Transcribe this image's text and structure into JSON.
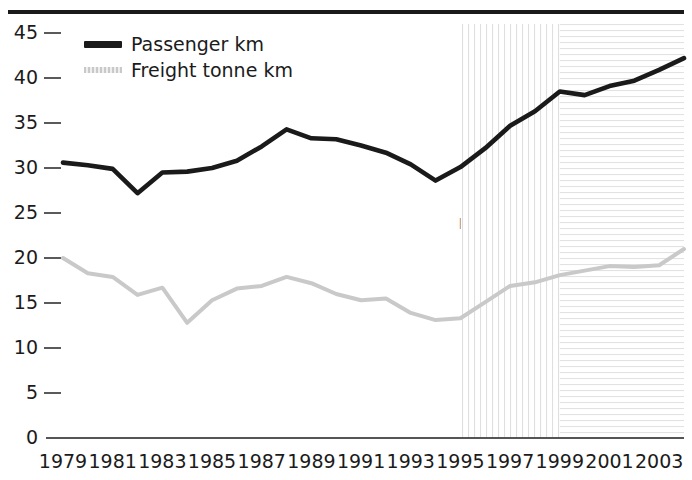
{
  "figure": {
    "background": "#ffffff",
    "top_rule_color": "#1a1a1a"
  },
  "legend": {
    "position": "top-left-inside",
    "items": [
      {
        "label": "Passenger km",
        "color": "#1a1a1a",
        "style": "solid-thick",
        "swatch_name": "passenger-swatch"
      },
      {
        "label": "Freight tonne km",
        "color": "#c9c9c9",
        "style": "light-dotted",
        "swatch_name": "freight-swatch"
      }
    ]
  },
  "annotations": [
    {
      "name": "post-privatisation",
      "text": "Post-\nprivatisation\nperiod",
      "region_start_year": 1995,
      "region_end_year": 1999,
      "hatch": "vertical",
      "hatch_color": "#e3e3e3"
    },
    {
      "name": "post-hatfield",
      "text": "Post-\nHatfield\nperiod",
      "region_start_year": 1999,
      "region_end_year": 2004,
      "hatch": "horizontal",
      "hatch_color": "#e6e6e6"
    }
  ],
  "chart_data": {
    "type": "line",
    "title": "",
    "subtitle": "",
    "xlabel": "",
    "ylabel": "",
    "xlim": [
      1979,
      2004
    ],
    "ylim": [
      0,
      46
    ],
    "grid": false,
    "legend_position": "top-left",
    "x": [
      1979,
      1980,
      1981,
      1982,
      1983,
      1984,
      1985,
      1986,
      1987,
      1988,
      1989,
      1990,
      1991,
      1992,
      1993,
      1994,
      1995,
      1996,
      1997,
      1998,
      1999,
      2000,
      2001,
      2002,
      2003,
      2004
    ],
    "xtick_labels": [
      "1979",
      "1981",
      "1983",
      "1985",
      "1987",
      "1989",
      "1991",
      "1993",
      "1995",
      "1997",
      "1999",
      "2001",
      "2003"
    ],
    "xtick_values": [
      1979,
      1981,
      1983,
      1985,
      1987,
      1989,
      1991,
      1993,
      1995,
      1997,
      1999,
      2001,
      2003
    ],
    "ytick_labels": [
      "0",
      "5",
      "10",
      "15",
      "20",
      "25",
      "30",
      "35",
      "40",
      "45"
    ],
    "ytick_values": [
      0,
      5,
      10,
      15,
      20,
      25,
      30,
      35,
      40,
      45
    ],
    "series": [
      {
        "name": "Passenger km",
        "color": "#1a1a1a",
        "values": [
          30.6,
          30.3,
          29.9,
          27.2,
          29.5,
          29.6,
          30.0,
          30.8,
          32.4,
          34.3,
          33.3,
          33.2,
          32.5,
          31.7,
          30.4,
          28.6,
          30.1,
          32.2,
          34.7,
          36.3,
          38.5,
          38.1,
          39.1,
          39.7,
          40.9,
          42.2
        ]
      },
      {
        "name": "Freight tonne km",
        "color": "#c9c9c9",
        "values": [
          20.0,
          18.3,
          17.9,
          15.9,
          16.7,
          12.8,
          15.3,
          16.6,
          16.9,
          17.9,
          17.2,
          16.0,
          15.3,
          15.5,
          13.9,
          13.1,
          13.3,
          15.1,
          16.9,
          17.3,
          18.1,
          18.6,
          19.1,
          19.0,
          19.2,
          21.0
        ]
      }
    ]
  }
}
